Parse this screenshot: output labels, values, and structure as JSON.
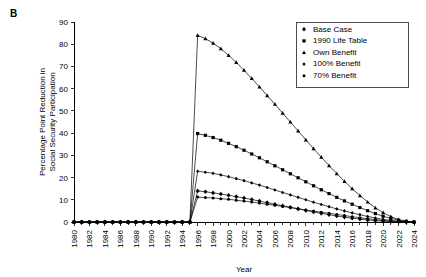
{
  "panel_label": "B",
  "chart_data": {
    "type": "line",
    "title": "",
    "xlabel": "Year",
    "ylabel": "Percentage Point Reduction in Social Security Participation",
    "ylabel_lines": [
      "Percentage Point Reduction in",
      "Social Security Participation"
    ],
    "xlim": [
      1980,
      2024
    ],
    "ylim": [
      0,
      90
    ],
    "yticks": [
      0,
      10,
      20,
      30,
      40,
      50,
      60,
      70,
      80,
      90
    ],
    "xticks": [
      1980,
      1982,
      1984,
      1986,
      1988,
      1990,
      1992,
      1994,
      1996,
      1998,
      2000,
      2002,
      2004,
      2006,
      2008,
      2010,
      2012,
      2014,
      2016,
      2018,
      2020,
      2022,
      2024
    ],
    "x_minor_step": 1,
    "grid": false,
    "legend_position": "top-right",
    "x": [
      1980,
      1981,
      1982,
      1983,
      1984,
      1985,
      1986,
      1987,
      1988,
      1989,
      1990,
      1991,
      1992,
      1993,
      1994,
      1995,
      1996,
      1997,
      1998,
      1999,
      2000,
      2001,
      2002,
      2003,
      2004,
      2005,
      2006,
      2007,
      2008,
      2009,
      2010,
      2011,
      2012,
      2013,
      2014,
      2015,
      2016,
      2017,
      2018,
      2019,
      2020,
      2021,
      2022,
      2023,
      2024
    ],
    "series": [
      {
        "name": "Base Case",
        "marker": "diamond",
        "values": [
          0,
          0,
          0,
          0,
          0,
          0,
          0,
          0,
          0,
          0,
          0,
          0,
          0,
          0,
          0,
          0,
          14.0,
          13.6,
          13.1,
          12.6,
          12.0,
          11.4,
          10.8,
          10.1,
          9.4,
          8.7,
          8.0,
          7.3,
          6.6,
          5.9,
          5.2,
          4.5,
          3.9,
          3.3,
          2.7,
          2.2,
          1.7,
          1.3,
          0.9,
          0.6,
          0.4,
          0.2,
          0.1,
          0.05,
          0
        ]
      },
      {
        "name": "1990 Life Table",
        "marker": "square",
        "values": [
          0,
          0,
          0,
          0,
          0,
          0,
          0,
          0,
          0,
          0,
          0,
          0,
          0,
          0,
          0,
          0,
          39.8,
          39.0,
          38.0,
          36.8,
          35.4,
          33.9,
          32.3,
          30.6,
          28.9,
          27.1,
          25.3,
          23.5,
          21.7,
          19.9,
          18.1,
          16.3,
          14.5,
          12.8,
          11.1,
          9.5,
          8.0,
          6.5,
          5.1,
          3.8,
          2.6,
          1.6,
          0.8,
          0.3,
          0
        ]
      },
      {
        "name": "Own Benefit",
        "marker": "triangle",
        "values": [
          0,
          0,
          0,
          0,
          0,
          0,
          0,
          0,
          0,
          0,
          0,
          0,
          0,
          0,
          0,
          0,
          84.0,
          82.5,
          80.5,
          78.0,
          75.0,
          71.8,
          68.3,
          64.6,
          60.8,
          56.9,
          53.0,
          49.0,
          45.0,
          41.0,
          37.0,
          33.0,
          29.2,
          25.4,
          21.8,
          18.3,
          15.0,
          11.9,
          9.0,
          6.4,
          4.2,
          2.4,
          1.1,
          0.4,
          0
        ]
      },
      {
        "name": "100% Benefit",
        "marker": "small-diamond",
        "values": [
          0,
          0,
          0,
          0,
          0,
          0,
          0,
          0,
          0,
          0,
          0,
          0,
          0,
          0,
          0,
          0,
          22.8,
          22.4,
          21.9,
          21.2,
          20.4,
          19.5,
          18.6,
          17.6,
          16.6,
          15.5,
          14.4,
          13.3,
          12.2,
          11.1,
          10.0,
          8.9,
          7.9,
          6.9,
          5.9,
          5.0,
          4.1,
          3.3,
          2.5,
          1.8,
          1.2,
          0.7,
          0.3,
          0.1,
          0
        ]
      },
      {
        "name": "70% Benefit",
        "marker": "circle",
        "values": [
          0,
          0,
          0,
          0,
          0,
          0,
          0,
          0,
          0,
          0,
          0,
          0,
          0,
          0,
          0,
          0,
          11.2,
          11.0,
          10.8,
          10.5,
          10.2,
          9.8,
          9.4,
          9.0,
          8.5,
          8.0,
          7.5,
          7.0,
          6.5,
          6.0,
          5.4,
          4.9,
          4.4,
          3.9,
          3.4,
          2.9,
          2.4,
          1.9,
          1.5,
          1.1,
          0.7,
          0.4,
          0.2,
          0.05,
          0
        ]
      }
    ],
    "legend_entries": [
      "Base Case",
      "1990 Life Table",
      "Own Benefit",
      "100% Benefit",
      "70% Benefit"
    ]
  }
}
